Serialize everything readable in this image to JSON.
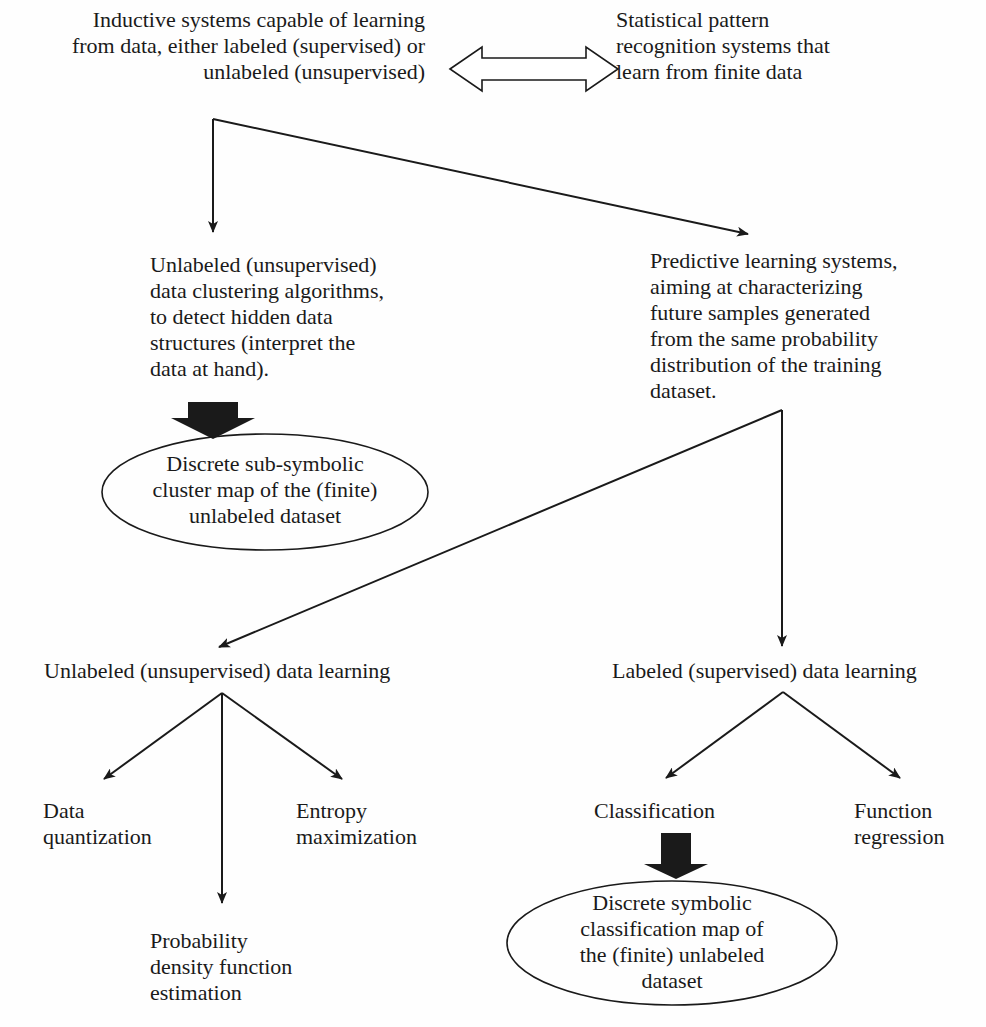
{
  "diagram": {
    "colors": {
      "ink": "#1a1a1a",
      "background": "#fefefe"
    },
    "nodes": {
      "inductive_systems": "Inductive systems capable of learning\nfrom data, either labeled (supervised) or\nunlabeled (unsupervised)",
      "statistical_pattern": "Statistical pattern\nrecognition systems that\nlearn from finite data",
      "clustering_algorithms": "Unlabeled (unsupervised)\ndata clustering algorithms,\nto detect hidden data\nstructures (interpret the\ndata at hand).",
      "predictive_learning": "Predictive learning systems,\naiming at characterizing\nfuture samples generated\nfrom the same probability\ndistribution of the training\ndataset.",
      "subsymbolic_map": "Discrete sub-symbolic\ncluster map of the (finite)\nunlabeled dataset",
      "unsupervised_learning": "Unlabeled (unsupervised) data learning",
      "supervised_learning": "Labeled (supervised) data  learning",
      "data_quantization": "Data\nquantization",
      "entropy_maximization": "Entropy\nmaximization",
      "pdf_estimation": "Probability\ndensity function\nestimation",
      "classification": "Classification",
      "function_regression": "Function\nregression",
      "symbolic_map": "Discrete symbolic\nclassification map of\nthe (finite) unlabeled\ndataset"
    },
    "edges": [
      {
        "from": "inductive_systems",
        "to": "statistical_pattern",
        "kind": "double-hollow-arrow"
      },
      {
        "from": "inductive_systems",
        "to": "clustering_algorithms",
        "kind": "arrow"
      },
      {
        "from": "inductive_systems",
        "to": "predictive_learning",
        "kind": "arrow"
      },
      {
        "from": "clustering_algorithms",
        "to": "subsymbolic_map",
        "kind": "block-arrow"
      },
      {
        "from": "predictive_learning",
        "to": "unsupervised_learning",
        "kind": "arrow"
      },
      {
        "from": "predictive_learning",
        "to": "supervised_learning",
        "kind": "arrow"
      },
      {
        "from": "unsupervised_learning",
        "to": "data_quantization",
        "kind": "arrow"
      },
      {
        "from": "unsupervised_learning",
        "to": "pdf_estimation",
        "kind": "arrow"
      },
      {
        "from": "unsupervised_learning",
        "to": "entropy_maximization",
        "kind": "arrow"
      },
      {
        "from": "supervised_learning",
        "to": "classification",
        "kind": "arrow"
      },
      {
        "from": "supervised_learning",
        "to": "function_regression",
        "kind": "arrow"
      },
      {
        "from": "classification",
        "to": "symbolic_map",
        "kind": "block-arrow"
      }
    ]
  }
}
